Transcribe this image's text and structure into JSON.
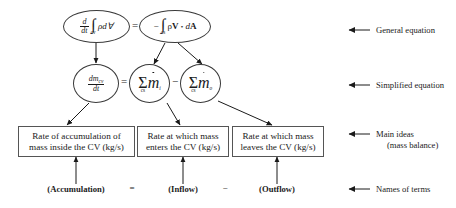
{
  "diagram": {
    "row1": {
      "left_node": {
        "name": "general-equation-lhs",
        "expr_plain": "d/dt ∫cv ρ dV",
        "numerator": "d",
        "denominator": "dt",
        "integral_limit": "cv",
        "integrand": "ρd∀"
      },
      "operator": "=",
      "right_node": {
        "name": "general-equation-rhs",
        "expr_plain": "− ∫cs ρV • dA",
        "minus": "−",
        "integral_limit": "cs",
        "integrand_rho": "ρ",
        "integrand_V": "V",
        "dot": "•",
        "integrand_dA_d": "d",
        "integrand_dA_A": "A"
      }
    },
    "row2": {
      "left_node": {
        "name": "simplified-equation-lhs",
        "expr_plain": "dmcv/dt",
        "numerator_d": "dm",
        "numerator_sub": "cv",
        "denominator": "dt"
      },
      "operator_eq": "=",
      "mid_node": {
        "name": "inflow-sum",
        "expr_plain": "Σcs ṁi",
        "sigma": "Σ",
        "limit": "cs",
        "mdot": "m",
        "sub": "i"
      },
      "operator_minus": "−",
      "right_node": {
        "name": "outflow-sum",
        "expr_plain": "Σcs ṁo",
        "sigma": "Σ",
        "limit": "cs",
        "mdot": "m",
        "sub": "o"
      }
    },
    "row3": {
      "box1": {
        "line1": "Rate of accumulation of",
        "line2": "mass inside the CV (kg/s)"
      },
      "operator_eq": "=",
      "box2": {
        "line1": "Rate at which mass",
        "line2": "enters the CV (kg/s)"
      },
      "operator_minus": "−",
      "box3": {
        "line1": "Rate at which mass",
        "line2": "leaves the CV (kg/s)"
      }
    },
    "row4": {
      "term1": "(Accumulation)",
      "operator_eq": "=",
      "term2": "(Inflow)",
      "operator_minus": "−",
      "term3": "(Outflow)"
    },
    "annotations": [
      {
        "name": "annotation-general-equation",
        "label": "General equation",
        "label2": ""
      },
      {
        "name": "annotation-simplified-equation",
        "label": "Simplified equation",
        "label2": ""
      },
      {
        "name": "annotation-main-ideas",
        "label": "Main ideas",
        "label2": "(mass balance)"
      },
      {
        "name": "annotation-names-of-terms",
        "label": "Names of terms",
        "label2": ""
      }
    ]
  },
  "colors": {
    "stroke": "#3a3a3a",
    "box_stroke": "#555555",
    "text": "#1a1a1a",
    "background": "#ffffff"
  }
}
